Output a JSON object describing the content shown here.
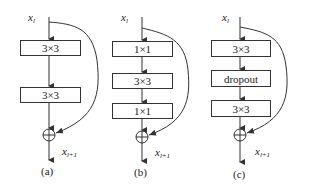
{
  "figure": {
    "panels": [
      {
        "id": "a",
        "caption": "(a)",
        "input_label": "x",
        "input_sub": "l",
        "output_label": "x",
        "output_sub": "l+1",
        "blocks": [
          "3×3",
          "3×3"
        ]
      },
      {
        "id": "b",
        "caption": "(b)",
        "input_label": "x",
        "input_sub": "l",
        "output_label": "x",
        "output_sub": "l+1",
        "blocks": [
          "1×1",
          "3×3",
          "1×1"
        ]
      },
      {
        "id": "c",
        "caption": "(c)",
        "input_label": "x",
        "input_sub": "l",
        "output_label": "x",
        "output_sub": "l+1",
        "blocks": [
          "3×3",
          "dropout",
          "3×3"
        ]
      }
    ],
    "sum_symbol": "⊕",
    "colors": {
      "stroke": "#333333",
      "background": "#ffffff"
    }
  }
}
